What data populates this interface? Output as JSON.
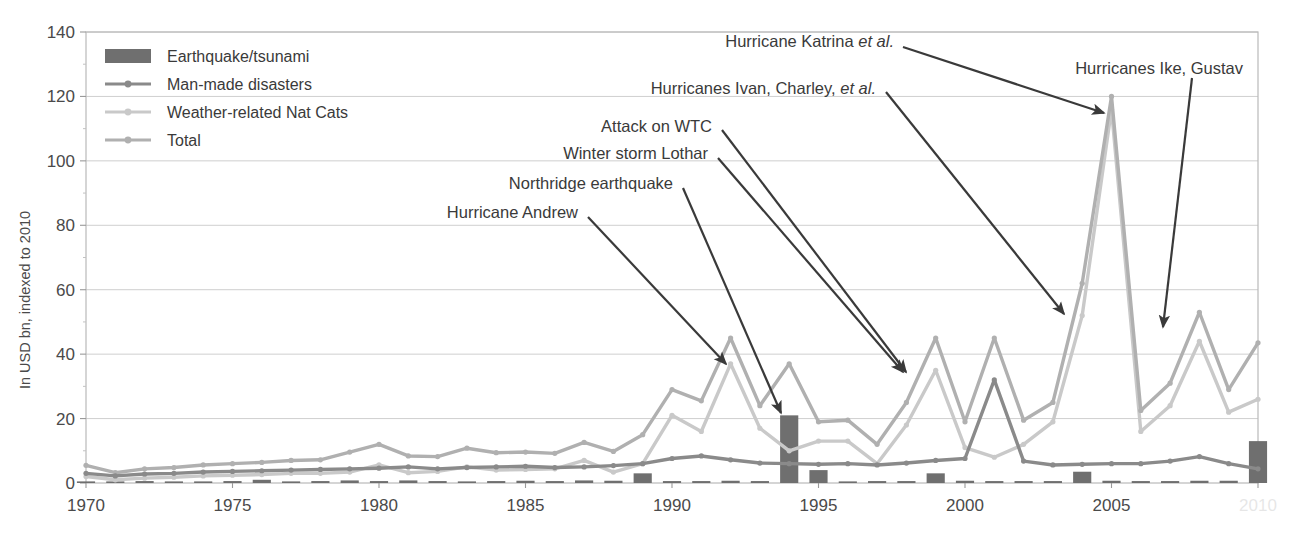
{
  "chart_data": {
    "type": "line",
    "title": "",
    "xlabel": "",
    "ylabel": "In USD bn, indexed to 2010",
    "xlim": [
      1970,
      2010
    ],
    "ylim": [
      0,
      140
    ],
    "yticks": [
      0,
      20,
      40,
      60,
      80,
      100,
      120,
      140
    ],
    "xticks": [
      1970,
      1975,
      1980,
      1985,
      1990,
      1995,
      2000,
      2005,
      2010
    ],
    "xtick_labels": [
      "1970",
      "1975",
      "1980",
      "1985",
      "1990",
      "1995",
      "2000",
      "2005",
      "2010"
    ],
    "grid": true,
    "legend_position": "top-left",
    "x": [
      1970,
      1971,
      1972,
      1973,
      1974,
      1975,
      1976,
      1977,
      1978,
      1979,
      1980,
      1981,
      1982,
      1983,
      1984,
      1985,
      1986,
      1987,
      1988,
      1989,
      1990,
      1991,
      1992,
      1993,
      1994,
      1995,
      1996,
      1997,
      1998,
      1999,
      2000,
      2001,
      2002,
      2003,
      2004,
      2005,
      2006,
      2007,
      2008,
      2009,
      2010
    ],
    "series": [
      {
        "name": "Earthquake/tsunami",
        "type": "bar",
        "color": "#6f6f6f",
        "values": [
          0.5,
          0.4,
          0.6,
          0.4,
          0.5,
          0.6,
          1.0,
          0.5,
          0.6,
          0.8,
          0.6,
          0.8,
          0.6,
          0.5,
          0.6,
          0.7,
          0.6,
          0.8,
          0.7,
          3.0,
          0.6,
          0.6,
          0.7,
          0.6,
          21.0,
          4.0,
          0.5,
          0.6,
          0.6,
          3.0,
          0.7,
          0.6,
          0.6,
          0.6,
          3.5,
          0.7,
          0.6,
          0.6,
          0.7,
          0.7,
          13.0
        ]
      },
      {
        "name": "Man-made disasters",
        "type": "line",
        "color": "#8a8a8a",
        "values": [
          3.0,
          2.2,
          2.8,
          3.0,
          3.4,
          3.6,
          3.8,
          4.0,
          4.2,
          4.4,
          4.6,
          5.0,
          4.4,
          4.8,
          5.0,
          5.2,
          4.8,
          5.0,
          5.4,
          6.0,
          7.6,
          8.4,
          7.2,
          6.2,
          6.0,
          5.8,
          6.0,
          5.6,
          6.2,
          7.0,
          7.6,
          32.0,
          6.8,
          5.6,
          5.8,
          6.0,
          6.0,
          6.8,
          8.2,
          6.0,
          4.4
        ]
      },
      {
        "name": "Weather-related Nat Cats",
        "type": "line",
        "color": "#c9c9c9",
        "values": [
          2.0,
          1.0,
          1.5,
          1.8,
          2.2,
          2.4,
          2.6,
          3.0,
          3.0,
          3.4,
          5.6,
          3.2,
          3.6,
          5.0,
          4.0,
          4.2,
          4.4,
          7.0,
          3.4,
          6.0,
          21.0,
          16.0,
          37.0,
          17.0,
          10.0,
          13.0,
          13.0,
          6.0,
          18.0,
          35.0,
          11.0,
          8.0,
          12.0,
          19.0,
          52.0,
          116.0,
          16.0,
          24.0,
          44.0,
          22.0,
          26.0
        ]
      },
      {
        "name": "Total",
        "type": "line",
        "color": "#b0b0b0",
        "values": [
          5.5,
          3.2,
          4.4,
          4.8,
          5.6,
          6.0,
          6.4,
          7.0,
          7.2,
          9.6,
          12.0,
          8.4,
          8.2,
          10.8,
          9.4,
          9.6,
          9.2,
          12.6,
          9.8,
          15.0,
          29.0,
          25.5,
          45.0,
          24.0,
          37.0,
          19.0,
          19.5,
          12.0,
          25.0,
          45.0,
          19.0,
          45.0,
          19.5,
          25.0,
          62.0,
          120.0,
          22.5,
          31.0,
          53.0,
          29.0,
          43.5
        ]
      }
    ],
    "annotations": [
      {
        "label_plain": "Hurricane Katrina ",
        "label_italic": "et al.",
        "tail": "",
        "text_x": 670,
        "text_y": 41,
        "anchor": "end",
        "text_end_x": 894,
        "arrow": [
          [
            903,
            47
          ],
          [
            1104,
            113
          ]
        ]
      },
      {
        "label_plain": "Hurricanes Ivan, Charley, ",
        "label_italic": "et al.",
        "tail": "",
        "text_x": 632,
        "text_y": 88,
        "anchor": "end",
        "text_end_x": 876,
        "arrow": [
          [
            886,
            92
          ],
          [
            1064,
            314
          ]
        ]
      },
      {
        "label_plain": "Hurricanes Ike, Gustav",
        "label_italic": "",
        "tail": "",
        "text_x": 1073,
        "text_y": 68,
        "anchor": "start",
        "text_end_x": 1243,
        "arrow": [
          [
            1192,
            78
          ],
          [
            1163,
            327
          ]
        ]
      },
      {
        "label_plain": "Attack on WTC",
        "label_italic": "",
        "tail": "",
        "text_x": 591,
        "text_y": 126,
        "anchor": "end",
        "text_end_x": 712,
        "arrow": [
          [
            722,
            130
          ],
          [
            906,
            372
          ]
        ]
      },
      {
        "label_plain": "Winter storm Lothar",
        "label_italic": "",
        "tail": "",
        "text_x": 543,
        "text_y": 153,
        "anchor": "end",
        "text_end_x": 708,
        "arrow": [
          [
            718,
            158
          ],
          [
            903,
            372
          ]
        ]
      },
      {
        "label_plain": "Northridge earthquake",
        "label_italic": "",
        "tail": "",
        "text_x": 488,
        "text_y": 183,
        "anchor": "end",
        "text_end_x": 673,
        "arrow": [
          [
            683,
            188
          ],
          [
            781,
            413
          ]
        ]
      },
      {
        "label_plain": "Hurricane Andrew",
        "label_italic": "",
        "tail": "",
        "text_x": 430,
        "text_y": 212,
        "anchor": "end",
        "text_end_x": 578,
        "arrow": [
          [
            588,
            217
          ],
          [
            726,
            364
          ]
        ]
      }
    ]
  },
  "legend": {
    "items": [
      {
        "label": "Earthquake/tsunami",
        "marker": "bar-swatch",
        "color": "#6f6f6f"
      },
      {
        "label": "Man-made disasters",
        "marker": "line-marker",
        "color": "#8a8a8a"
      },
      {
        "label": "Weather-related Nat Cats",
        "marker": "line-marker",
        "color": "#c9c9c9"
      },
      {
        "label": "Total",
        "marker": "line-marker",
        "color": "#b0b0b0"
      }
    ]
  },
  "axes": {
    "y_title": "In USD bn, indexed to 2010",
    "y_labels": [
      "140",
      "120",
      "100",
      "80",
      "60",
      "40",
      "20",
      "0"
    ],
    "x_labels": [
      "1970",
      "1975",
      "1980",
      "1985",
      "1990",
      "1995",
      "2000",
      "2005",
      "2010"
    ]
  },
  "colors": {
    "earthquake": "#6f6f6f",
    "manmade": "#8a8a8a",
    "weather": "#c9c9c9",
    "total": "#b0b0b0",
    "grid": "#cfcfcf",
    "frame": "#b9b9b9",
    "arrow": "#3a3a3a",
    "text": "#3d3d3d"
  }
}
